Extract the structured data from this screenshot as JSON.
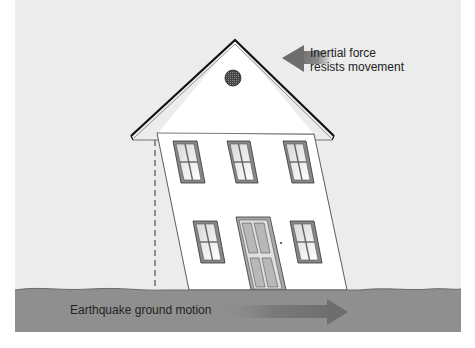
{
  "diagram": {
    "labels": {
      "inertial_line1": "Inertial force",
      "inertial_line2": "resists movement",
      "ground_motion": "Earthquake ground motion"
    },
    "colors": {
      "sky": "#ececec",
      "ground": "#8f8f8f",
      "wall": "#ffffff",
      "outline": "#222222",
      "arrow": "#7a7a7a",
      "door_panel": "#b8b8b8",
      "window_glass": "#f2f2f2"
    },
    "arrows": [
      {
        "name": "inertial-force-arrow",
        "direction": "left"
      },
      {
        "name": "ground-motion-arrow",
        "direction": "right"
      }
    ]
  }
}
